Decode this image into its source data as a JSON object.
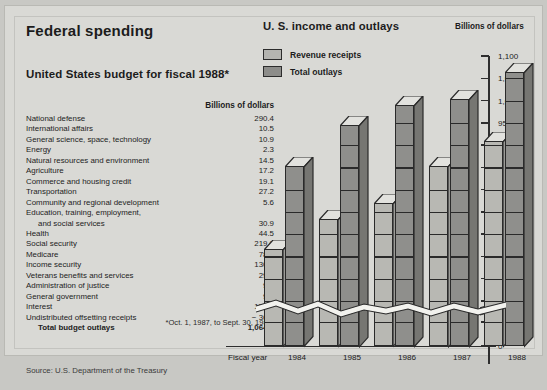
{
  "left_panel": {
    "heading": "Federal spending",
    "subheading": "United States budget for fiscal 1988*",
    "units_header": "Billions of dollars",
    "rows": [
      {
        "label": "National defense",
        "value": "290.4"
      },
      {
        "label": "International affairs",
        "value": "10.5"
      },
      {
        "label": "General science, space, technology",
        "value": "10.9"
      },
      {
        "label": "Energy",
        "value": "2.3"
      },
      {
        "label": "Natural resources and environment",
        "value": "14.5"
      },
      {
        "label": "Agriculture",
        "value": "17.2"
      },
      {
        "label": "Commerce and housing credit",
        "value": "19.1"
      },
      {
        "label": "Transportation",
        "value": "27.2"
      },
      {
        "label": "Community and regional development",
        "value": "5.6"
      },
      {
        "label": "Education, training, employment,",
        "value": ""
      },
      {
        "label": "and social services",
        "value": "30.9",
        "indent": true
      },
      {
        "label": "Health",
        "value": "44.5"
      },
      {
        "label": "Social security",
        "value": "219.0"
      },
      {
        "label": "Medicare",
        "value": "78.8"
      },
      {
        "label": "Income security",
        "value": "130.2"
      },
      {
        "label": "Veterans benefits and services",
        "value": "29.2"
      },
      {
        "label": "Administration of justice",
        "value": "9.2"
      },
      {
        "label": "General government",
        "value": "9.5"
      },
      {
        "label": "Interest",
        "value": "151.7"
      },
      {
        "label": "Undistributed offsetting receipts",
        "value": "− 36.6"
      },
      {
        "label": "Total budget outlays",
        "value": "1,064.1",
        "total": true
      }
    ],
    "footnote": "*Oct. 1, 1987, to Sept. 30, 1988.",
    "source": "Source: U.S. Department of the Treasury"
  },
  "chart_data": {
    "type": "bar",
    "title": "U. S. income and outlays",
    "units_label": "Billions of dollars",
    "xlabel": "Fiscal year",
    "ylabel": "Billions of dollars",
    "categories": [
      "1984",
      "1985",
      "1986",
      "1987",
      "1988"
    ],
    "series": [
      {
        "name": "Revenue receipts",
        "color": "#b8b8b3",
        "values": [
          666,
          734,
          769,
          854,
          909
        ]
      },
      {
        "name": "Total outlays",
        "color": "#8f8f8c",
        "values": [
          852,
          946,
          990,
          1004,
          1064
        ]
      }
    ],
    "ylim": [
      0,
      1100
    ],
    "axis_break": {
      "below": 50,
      "above": 550
    },
    "yticks": [
      "1,100",
      "1,050",
      "1,000",
      "950",
      "900",
      "850",
      "800",
      "750",
      "700",
      "650",
      "600",
      "550",
      "50",
      "0"
    ],
    "grid": false,
    "legend_position": "top-left"
  },
  "colors": {
    "panel_background": "#d9d9d5",
    "page_background": "#c8c8c4",
    "ink": "#1c1c1c",
    "revenue": "#b8b8b3",
    "outlays": "#8f8f8c"
  }
}
